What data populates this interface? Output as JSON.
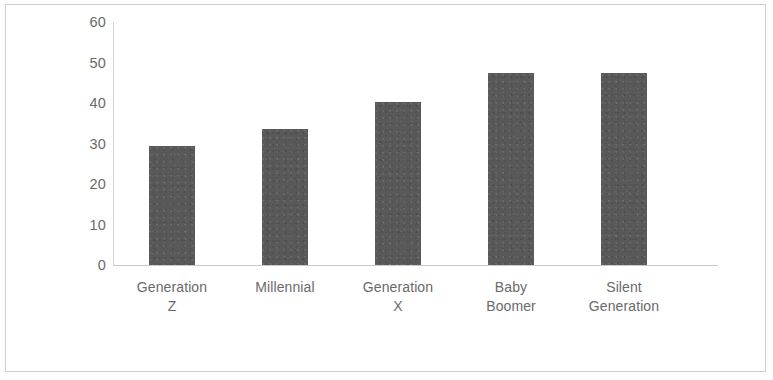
{
  "chart_data": {
    "type": "bar",
    "title": "",
    "subtitle": "",
    "xlabel": "",
    "ylabel": "",
    "categories": [
      "Generation Z",
      "Millennial",
      "Generation X",
      "Baby Boomer",
      "Silent Generation"
    ],
    "category_lines": [
      [
        "Generation",
        "Z"
      ],
      [
        "Millennial",
        ""
      ],
      [
        "Generation",
        "X"
      ],
      [
        "Baby",
        "Boomer"
      ],
      [
        "Silent",
        "Generation"
      ]
    ],
    "values": [
      29.5,
      33.7,
      40.2,
      47.5,
      47.5
    ],
    "ylim": [
      0,
      60
    ],
    "ytick_labels": [
      "60",
      "50",
      "40",
      "30",
      "20",
      "10",
      "0"
    ],
    "ytick_values": [
      60,
      50,
      40,
      30,
      20,
      10,
      0
    ],
    "grid": false,
    "legend": false,
    "bar_color": "#595959",
    "axis_color": "#cfcfcf",
    "label_color": "#6a6a6a"
  },
  "axis": {
    "y_ticks": [
      {
        "label": "60"
      },
      {
        "label": "50"
      },
      {
        "label": "40"
      },
      {
        "label": "30"
      },
      {
        "label": "20"
      },
      {
        "label": "10"
      },
      {
        "label": "0"
      }
    ]
  },
  "bars": [
    {
      "line1": "Generation",
      "line2": "Z",
      "value": 29.5
    },
    {
      "line1": "Millennial",
      "line2": "",
      "value": 33.7
    },
    {
      "line1": "Generation",
      "line2": "X",
      "value": 40.2
    },
    {
      "line1": "Baby",
      "line2": "Boomer",
      "value": 47.5
    },
    {
      "line1": "Silent",
      "line2": "Generation",
      "value": 47.5
    }
  ]
}
